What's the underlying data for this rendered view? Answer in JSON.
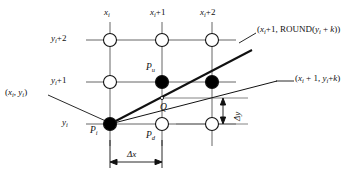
{
  "figure": {
    "type": "raster-line-scan-conversion-diagram",
    "colors": {
      "stroke": "#111111",
      "grid": "#555555",
      "fill_dark": "#000000",
      "fill_light": "#ffffff",
      "background": "#ffffff"
    },
    "axis_labels": {
      "columns": [
        {
          "id": "col-0",
          "text": "x",
          "sub": "i",
          "suffix": "",
          "x": 107,
          "y": 10
        },
        {
          "id": "col-1",
          "text": "x",
          "sub": "i",
          "suffix": "+1",
          "x": 153,
          "y": 10
        },
        {
          "id": "col-2",
          "text": "x",
          "sub": "i",
          "suffix": "+2",
          "x": 203,
          "y": 10
        }
      ],
      "rows": [
        {
          "id": "row-2",
          "text": "y",
          "sub": "i",
          "suffix": "+2",
          "x": 52,
          "y": 36
        },
        {
          "id": "row-1",
          "text": "y",
          "sub": "i",
          "suffix": "+1",
          "x": 52,
          "y": 78
        },
        {
          "id": "row-0",
          "text": "y",
          "sub": "i",
          "suffix": "",
          "x": 62,
          "y": 120
        }
      ]
    },
    "point_labels": [
      {
        "id": "p-u",
        "text": "P",
        "sub": "u",
        "x": 147,
        "y": 66
      },
      {
        "id": "p-i",
        "text": "P",
        "sub": "i",
        "x": 92,
        "y": 126
      },
      {
        "id": "p-d",
        "text": "P",
        "sub": "d",
        "x": 147,
        "y": 131
      },
      {
        "id": "q",
        "text": "Q",
        "sub": "",
        "x": 161,
        "y": 108
      }
    ],
    "callouts": [
      {
        "id": "callout-origin",
        "text": "(x",
        "full_text": "(x_i, y_i)",
        "x": 6,
        "y": 88
      },
      {
        "id": "callout-round",
        "full_text": "(x_i+1, ROUND(y_i + k))",
        "x": 258,
        "y": 27
      },
      {
        "id": "callout-exact",
        "full_text": "(x_i + 1, y_i+k)",
        "x": 296,
        "y": 76
      }
    ],
    "dimension_labels": [
      {
        "id": "delta-x",
        "text": "Δx",
        "x": 127,
        "y": 152
      },
      {
        "id": "delta-y",
        "text": "Δy",
        "x": 230,
        "y": 118
      }
    ],
    "grid": {
      "columns_x": [
        110,
        162,
        212
      ],
      "rows_y": [
        40,
        82,
        124
      ],
      "node_radius": 6.5,
      "nodes": [
        {
          "col": 0,
          "row": 0,
          "filled": false
        },
        {
          "col": 1,
          "row": 0,
          "filled": false
        },
        {
          "col": 2,
          "row": 0,
          "filled": false
        },
        {
          "col": 0,
          "row": 1,
          "filled": false
        },
        {
          "col": 1,
          "row": 1,
          "filled": true
        },
        {
          "col": 2,
          "row": 1,
          "filled": true
        },
        {
          "col": 0,
          "row": 2,
          "filled": true
        },
        {
          "col": 1,
          "row": 2,
          "filled": false
        },
        {
          "col": 2,
          "row": 2,
          "filled": false
        }
      ]
    },
    "lines": {
      "ideal_line_round": {
        "from": [
          110,
          124
        ],
        "to": [
          252,
          50
        ]
      },
      "ideal_line_exact": {
        "from": [
          110,
          124
        ],
        "to": [
          277,
          81
        ]
      },
      "intersection_q": [
        162,
        98
      ]
    }
  }
}
